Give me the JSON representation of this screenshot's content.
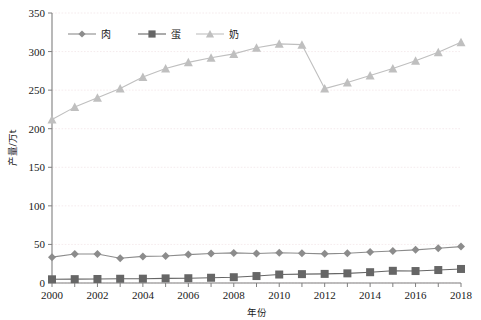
{
  "chart_data": {
    "type": "line",
    "title": "",
    "xlabel": "年份",
    "ylabel": "产量/万t",
    "xlim": [
      2000,
      2018
    ],
    "ylim": [
      0,
      350
    ],
    "yticks": [
      0,
      50,
      100,
      150,
      200,
      250,
      300,
      350
    ],
    "xticks": [
      2000,
      2002,
      2004,
      2006,
      2008,
      2010,
      2012,
      2014,
      2016,
      2018
    ],
    "x": [
      2000,
      2001,
      2002,
      2003,
      2004,
      2005,
      2006,
      2007,
      2008,
      2009,
      2010,
      2011,
      2012,
      2013,
      2014,
      2015,
      2016,
      2017,
      2018
    ],
    "grid": true,
    "legend_position": "top-left-inside",
    "series": [
      {
        "name": "肉",
        "marker": "diamond",
        "color": "#8c8c8c",
        "values": [
          33.5,
          37.5,
          37.5,
          32.0,
          34.5,
          35.0,
          36.8,
          38.2,
          39.0,
          38.3,
          39.2,
          38.5,
          37.8,
          38.6,
          40.2,
          41.5,
          43.0,
          45.0,
          47.2
        ]
      },
      {
        "name": "蛋",
        "marker": "square",
        "color": "#666666",
        "values": [
          4.8,
          5.0,
          5.2,
          5.5,
          5.6,
          6.0,
          6.2,
          6.8,
          7.5,
          9.0,
          11.0,
          11.5,
          11.8,
          12.5,
          14.0,
          15.8,
          15.5,
          16.8,
          18.2
        ]
      },
      {
        "name": "奶",
        "marker": "triangle",
        "color": "#bfbfbf",
        "values": [
          212,
          228,
          240,
          252,
          267,
          278,
          286,
          292,
          297,
          305,
          310,
          309,
          252,
          260,
          269,
          278,
          288,
          299,
          312
        ]
      }
    ]
  },
  "legend": {
    "items": [
      {
        "label": "肉"
      },
      {
        "label": "蛋"
      },
      {
        "label": "奶"
      }
    ]
  },
  "axes": {
    "y_tick_labels": [
      "0",
      "50",
      "100",
      "150",
      "200",
      "250",
      "300",
      "350"
    ],
    "x_tick_labels": [
      "2000",
      "2002",
      "2004",
      "2006",
      "2008",
      "2010",
      "2012",
      "2014",
      "2016",
      "2018"
    ],
    "x_title": "年份",
    "y_title": "产量/万t"
  }
}
